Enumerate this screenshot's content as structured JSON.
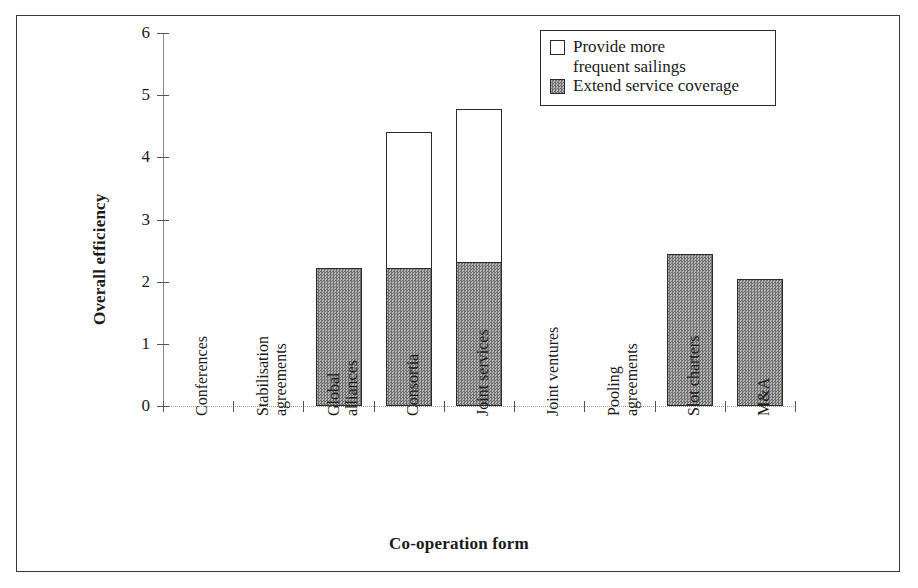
{
  "chart_data": {
    "type": "bar",
    "subtype": "stacked-vertical",
    "title": "",
    "xlabel": "Co-operation form",
    "ylabel": "Overall efficiency",
    "ylim": [
      0,
      6
    ],
    "yticks": [
      0,
      1,
      2,
      3,
      4,
      5,
      6
    ],
    "ytick_labels": [
      "0",
      "1",
      "2",
      "3",
      "4",
      "5",
      "6"
    ],
    "grid": false,
    "legend_position": "top-right",
    "categories": [
      "Conferences",
      "Stabilisation agreements",
      "Global alliances",
      "Consortia",
      "Joint services",
      "Joint ventures",
      "Pooling agreements",
      "Slot charters",
      "M&A"
    ],
    "category_label_lines": [
      [
        "Conferences"
      ],
      [
        "Stabilisation",
        "agreements"
      ],
      [
        "Global",
        "alliances"
      ],
      [
        "Consortia"
      ],
      [
        "Joint services"
      ],
      [
        "Joint ventures"
      ],
      [
        "Pooling",
        "agreements"
      ],
      [
        "Slot charters"
      ],
      [
        "M&A"
      ]
    ],
    "series": [
      {
        "name": "Extend service coverage",
        "fill": "gray",
        "values": [
          0,
          0,
          2.22,
          2.22,
          2.32,
          0,
          0,
          2.45,
          2.05
        ]
      },
      {
        "name": "Provide more frequent sailings",
        "fill": "white",
        "values": [
          0,
          0,
          0,
          2.18,
          2.45,
          0,
          0,
          0,
          0
        ]
      }
    ],
    "totals": [
      0,
      0,
      2.22,
      4.4,
      4.77,
      0,
      0,
      2.45,
      2.05
    ]
  },
  "legend": {
    "entries": [
      {
        "label": "Provide more\nfrequent sailings",
        "swatch": "white"
      },
      {
        "label": "Extend service coverage",
        "swatch": "gray"
      }
    ]
  },
  "axes": {
    "y_title": "Overall efficiency",
    "x_title": "Co-operation form"
  },
  "colors": {
    "bar_gray": "#8c8c8c",
    "bar_white": "#ffffff",
    "outline": "#2a2a2a",
    "axis": "#8a8a8a",
    "text": "#1a1a1a"
  }
}
